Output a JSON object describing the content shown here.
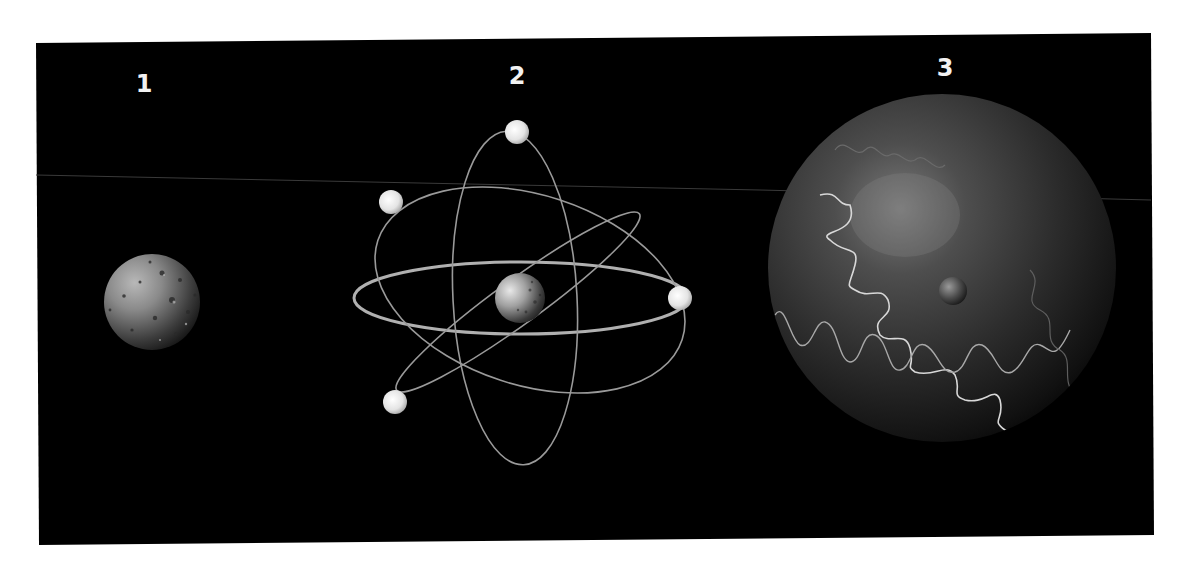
{
  "figure": {
    "background": "#000000",
    "page_background": "#ffffff",
    "panels": [
      {
        "id": "1",
        "label": "1",
        "description": "solid sphere model"
      },
      {
        "id": "2",
        "label": "2",
        "description": "orbital model with nucleus and four electrons"
      },
      {
        "id": "3",
        "label": "3",
        "description": "large sphere with small nucleus and wave paths"
      }
    ]
  }
}
